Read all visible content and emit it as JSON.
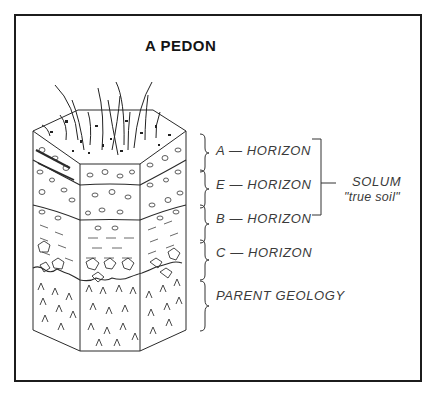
{
  "figure": {
    "title": "A PEDON",
    "horizons": [
      {
        "id": "A",
        "label": "A — HORIZON"
      },
      {
        "id": "E",
        "label": "E — HORIZON"
      },
      {
        "id": "B",
        "label": "B — HORIZON"
      },
      {
        "id": "C",
        "label": "C — HORIZON"
      },
      {
        "id": "R",
        "label": "PARENT  GEOLOGY"
      }
    ],
    "solum": {
      "label": "SOLUM",
      "sublabel": "\"true soil\"",
      "spans": [
        "A",
        "E",
        "B"
      ]
    },
    "colors": {
      "ink": "#1c1c1c",
      "label_ink": "#3a3a3a",
      "background": "#ffffff"
    }
  }
}
